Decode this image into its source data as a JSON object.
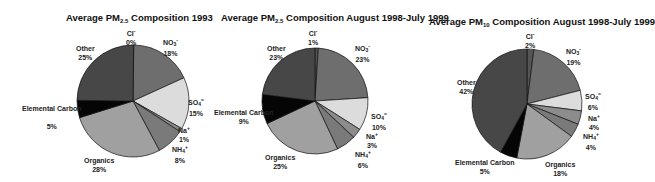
{
  "chart_data": [
    {
      "type": "pie",
      "title": "Average PM2.5 Composition 1993",
      "title_parts": {
        "pre": "Average PM",
        "sub": "2.5",
        "post": " Composition 1993"
      },
      "categories": [
        "Cl-",
        "NO3-",
        "SO4=",
        "Na+",
        "NH4+",
        "Organics",
        "Elemental Carbon",
        "Other"
      ],
      "values": [
        0,
        18,
        15,
        1,
        8,
        28,
        5,
        25
      ],
      "labels": [
        "0%",
        "18%",
        "15%",
        "1%",
        "8%",
        "28%",
        "5%",
        "25%"
      ],
      "unit": "%"
    },
    {
      "type": "pie",
      "title": "Average PM2.5 Composition August 1998-July 1999",
      "title_parts": {
        "pre": "Average PM",
        "sub": "2.5",
        "post": " Composition August 1998-July 1999"
      },
      "categories": [
        "Cl-",
        "NO3-",
        "SO4=",
        "Na+",
        "NH4+",
        "Organics",
        "Elemental Carbon",
        "Other"
      ],
      "values": [
        1,
        23,
        10,
        3,
        6,
        25,
        9,
        23
      ],
      "labels": [
        "1%",
        "23%",
        "10%",
        "3%",
        "6%",
        "25%",
        "9%",
        "23%"
      ],
      "unit": "%"
    },
    {
      "type": "pie",
      "title": "Average PM10 Composition August 1998-July 1999",
      "title_parts": {
        "pre": "Average PM",
        "sub": "10",
        "post": " Composition August 1998-July 1999"
      },
      "categories": [
        "Cl-",
        "NO3-",
        "SO4=",
        "Na+",
        "NH4+",
        "Organics",
        "Elemental Carbon",
        "Other"
      ],
      "values": [
        2,
        19,
        6,
        4,
        4,
        18,
        5,
        42
      ],
      "labels": [
        "2%",
        "19%",
        "6%",
        "4%",
        "4%",
        "18%",
        "5%",
        "42%"
      ],
      "unit": "%"
    }
  ],
  "species": {
    "cl": {
      "base": "Cl",
      "sup": "-"
    },
    "no3": {
      "base": "NO",
      "sub": "3",
      "sup": "-"
    },
    "so4": {
      "base": "SO",
      "sub": "4",
      "sup": "="
    },
    "na": {
      "base": "Na",
      "sup": "+"
    },
    "nh4": {
      "base": "NH",
      "sub": "4",
      "sup": "+"
    },
    "organics": "Organics",
    "ec": "Elemental Carbon",
    "other": "Other"
  },
  "slice_colors": {
    "cl": "#555555",
    "no3": "#6e6e6e",
    "so4": "#dcdcdc",
    "na": "#8c8c8c",
    "nh4": "#7a7a7a",
    "organics": "#a0a0a0",
    "ec": "#050505",
    "other": "#474747"
  }
}
